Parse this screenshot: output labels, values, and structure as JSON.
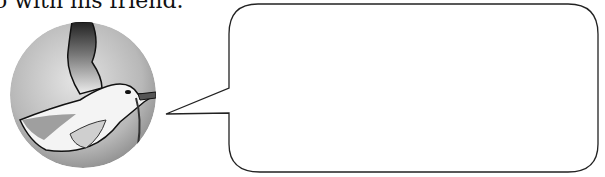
{
  "caption": {
    "text": "o with his friend."
  },
  "illustration": {
    "subject": "seagull-in-flight",
    "shape": "circle"
  },
  "speech_bubble": {
    "text": "",
    "stroke_color": "#222222",
    "fill_color": "#ffffff"
  }
}
